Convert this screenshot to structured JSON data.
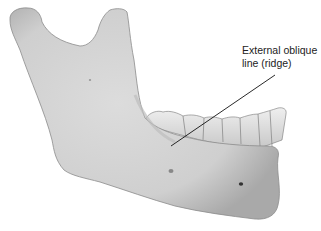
{
  "figure": {
    "label": {
      "line1": "External oblique",
      "line2": "line (ridge)"
    },
    "colors": {
      "bone": "#d4d4d4",
      "bone_shadow": "#a8a8a8",
      "teeth": "#e6e6e6",
      "leader": "#111111",
      "background": "#ffffff"
    }
  }
}
